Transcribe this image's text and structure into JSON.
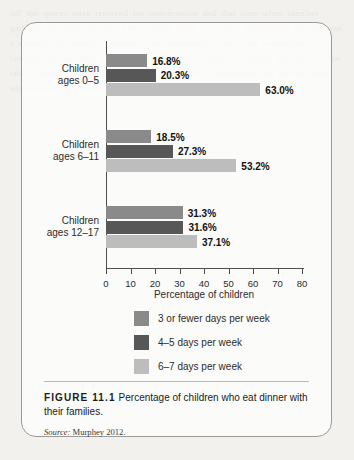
{
  "figure": {
    "number": "FIGURE 11.1",
    "caption": "Percentage of children who eat dinner with their families.",
    "source_prefix": "Source:",
    "source_text": "Murphey 2012."
  },
  "background_text": "fill the spaces once reserved for conversation and that time when families gathered to share the day. The evening meal, for many households, has become a casualty of crowded calendars and competing screens, yet researchers continue to find that the ritual itself carries weight far beyond the food on the table, shaping vocabulary, habits, and a sense of belonging that persists into adolescence and beyond.",
  "chart_data": {
    "type": "bar",
    "orientation": "horizontal",
    "title": "",
    "xlabel": "Percentage of children",
    "ylabel": "",
    "xlim": [
      0,
      80
    ],
    "xticks": [
      0,
      10,
      20,
      30,
      40,
      50,
      60,
      70,
      80
    ],
    "grid": false,
    "legend_position": "below",
    "value_suffix": "%",
    "categories": [
      "Children ages 0–5",
      "Children ages 6–11",
      "Children ages 12–17"
    ],
    "series": [
      {
        "name": "3 or fewer days per week",
        "color": "#8a8a8a",
        "values": [
          16.8,
          18.5,
          31.3
        ],
        "labels": [
          "16.8%",
          "18.5%",
          "31.3%"
        ]
      },
      {
        "name": "4–5 days per week",
        "color": "#575757",
        "values": [
          20.3,
          27.3,
          31.6
        ],
        "labels": [
          "20.3%",
          "27.3%",
          "31.6%"
        ]
      },
      {
        "name": "6–7 days per week",
        "color": "#bdbdbd",
        "values": [
          63.0,
          53.2,
          37.1
        ],
        "labels": [
          "63.0%",
          "53.2%",
          "37.1%"
        ]
      }
    ]
  }
}
